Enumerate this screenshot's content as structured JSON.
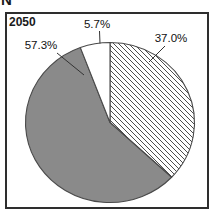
{
  "page": {
    "corner_letter": "N"
  },
  "chart_data": {
    "type": "pie",
    "title": "2050",
    "unit": "%",
    "slices": [
      {
        "label": "37.0%",
        "value": 37.0,
        "fill": "hatch-diagonal"
      },
      {
        "label": "57.3%",
        "value": 57.3,
        "fill": "#8a8a8a"
      },
      {
        "label": "5.7%",
        "value": 5.7,
        "fill": "#ffffff"
      }
    ],
    "start_angle_deg": 0,
    "direction": "clockwise",
    "legend": "none",
    "outline_color": "#4a4a4a",
    "hatch_line_color": "#4d4d4d",
    "leader_line_color": "#333333",
    "label_color": "#111111"
  }
}
